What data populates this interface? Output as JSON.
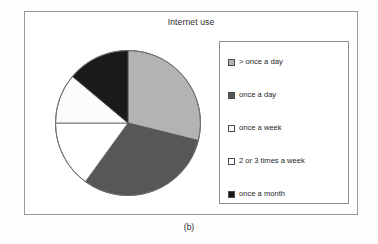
{
  "figure": {
    "caption": "(b)",
    "frame_border_color": "#9a9a9a",
    "background_color": "#ffffff"
  },
  "chart_data": {
    "type": "pie",
    "title": "Internet use",
    "xlabel": "",
    "ylabel": "",
    "grid": false,
    "legend_position": "right",
    "start_angle_deg": 0,
    "direction": "clockwise",
    "categories": [
      "> once a day",
      "once a day",
      "once a week",
      "2 or 3 times a week",
      "once a month"
    ],
    "values": [
      29,
      31,
      15,
      11,
      14
    ],
    "unit": "percent",
    "slice_angles_deg": [
      104,
      112,
      54,
      40,
      50
    ],
    "colors": [
      "#b3b3b3",
      "#575757",
      "#ffffff",
      "#fbfbfb",
      "#1a1a1a"
    ],
    "slice_border_color": "#5a5a5a",
    "series": [
      {
        "name": "Internet use",
        "values": [
          29,
          31,
          15,
          11,
          14
        ]
      }
    ]
  },
  "legend": {
    "border_color": "#8d8d8d",
    "items": [
      {
        "label": "> once a day",
        "color": "#b3b3b3",
        "swatch_name": "legend-swatch-greater-than-once-a-day"
      },
      {
        "label": "once a day",
        "color": "#575757",
        "swatch_name": "legend-swatch-once-a-day"
      },
      {
        "label": "once a week",
        "color": "#ffffff",
        "swatch_name": "legend-swatch-once-a-week"
      },
      {
        "label": "2 or 3 times a week",
        "color": "#ffffff",
        "swatch_name": "legend-swatch-2-or-3-times-a-week"
      },
      {
        "label": "once a month",
        "color": "#1a1a1a",
        "swatch_name": "legend-swatch-once-a-month"
      }
    ]
  }
}
